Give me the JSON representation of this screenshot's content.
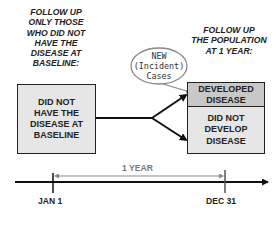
{
  "headers": {
    "left": [
      "FOLLOW UP",
      "ONLY THOSE",
      "WHO DID NOT",
      "HAVE THE",
      "DISEASE AT",
      "BASELINE:"
    ],
    "right": [
      "FOLLOW UP",
      "THE POPULATION",
      "AT 1 YEAR:"
    ]
  },
  "boxes": {
    "baseline": [
      "DID NOT",
      "HAVE THE",
      "DISEASE AT",
      "BASELINE"
    ],
    "developed": [
      "DEVELOPED",
      "DISEASE"
    ],
    "not_developed": [
      "DID NOT",
      "DEVELOP",
      "DISEASE"
    ]
  },
  "bubble": [
    "NEW",
    "(Incident)",
    "Cases"
  ],
  "timeline": {
    "duration_label": "1 YEAR",
    "start_label": "JAN 1",
    "end_label": "DEC 31"
  },
  "colors": {
    "box_fill": "#e6e6e6",
    "developed_fill": "#c8c8c8",
    "line": "#222222",
    "bracket": "#888888"
  }
}
